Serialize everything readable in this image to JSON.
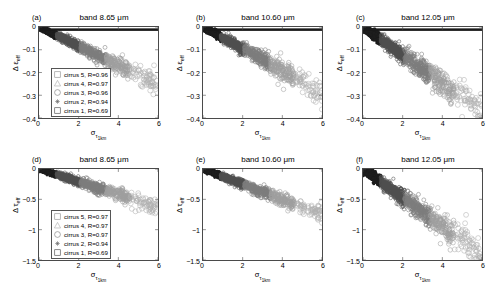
{
  "figure": {
    "background": "#ffffff",
    "width": 495,
    "height": 288
  },
  "axis_labels": {
    "y_top": "Δ ε",
    "y_top_sub": "eff",
    "y_bottom": "Δ τ",
    "y_bottom_sub": "eff",
    "x_main": "σ",
    "x_sub": "τ",
    "x_sub2": "1km"
  },
  "legend_title_common": "cirrus",
  "panels": [
    {
      "letter": "(a)",
      "title": "band 8.65 μm",
      "has_legend": true,
      "legend": [
        {
          "marker": "square-open",
          "label": "cirrus 5, R=0.96",
          "color": "#9a9a9a"
        },
        {
          "marker": "triangle-open",
          "label": "cirrus 4, R=0.97",
          "color": "#b5b5b5"
        },
        {
          "marker": "circle-open",
          "label": "cirrus 3, R=0.96",
          "color": "#8a8a8a"
        },
        {
          "marker": "star",
          "label": "cirrus 2, R=0.94",
          "color": "#6d6d6d"
        },
        {
          "marker": "square-open",
          "label": "cirrus 1, R=0.69",
          "color": "#5a5a5a"
        }
      ]
    },
    {
      "letter": "(b)",
      "title": "band 10.60 μm",
      "has_legend": false,
      "legend": []
    },
    {
      "letter": "(c)",
      "title": "band 12.05 μm",
      "has_legend": false,
      "legend": []
    },
    {
      "letter": "(d)",
      "title": "band 8.65 μm",
      "has_legend": true,
      "legend": [
        {
          "marker": "square-open",
          "label": "cirrus 5, R=0.97",
          "color": "#9a9a9a"
        },
        {
          "marker": "triangle-open",
          "label": "cirrus 4, R=0.97",
          "color": "#b5b5b5"
        },
        {
          "marker": "circle-open",
          "label": "cirrus 3, R=0.97",
          "color": "#8a8a8a"
        },
        {
          "marker": "star",
          "label": "cirrus 2, R=0.94",
          "color": "#6d6d6d"
        },
        {
          "marker": "square-open",
          "label": "cirrus 1, R=0.69",
          "color": "#5a5a5a"
        }
      ]
    },
    {
      "letter": "(e)",
      "title": "band 10.60 μm",
      "has_legend": false,
      "legend": []
    },
    {
      "letter": "(f)",
      "title": "band 12.05 μm",
      "has_legend": false,
      "legend": []
    }
  ],
  "chart_data": [
    {
      "id": "a",
      "type": "scatter",
      "title": "band 8.65 μm",
      "panel_letter": "(a)",
      "xlabel": "σ_τ1km",
      "ylabel": "Δ ε_eff",
      "xlim": [
        0,
        6
      ],
      "ylim": [
        -0.4,
        0
      ],
      "xticks": [
        0,
        2,
        4,
        6
      ],
      "yticks": [
        0,
        -0.1,
        -0.2,
        -0.3,
        -0.4
      ],
      "grid": false,
      "legend_position": "lower-left",
      "slope": -0.042,
      "spread": 0.018,
      "series": [
        {
          "name": "cirrus 5, R=0.96",
          "correlation": 0.96,
          "marker": "square-open",
          "color": "#9a9a9a"
        },
        {
          "name": "cirrus 4, R=0.97",
          "correlation": 0.97,
          "marker": "triangle-open",
          "color": "#b5b5b5"
        },
        {
          "name": "cirrus 3, R=0.96",
          "correlation": 0.96,
          "marker": "circle-open",
          "color": "#8a8a8a"
        },
        {
          "name": "cirrus 2, R=0.94",
          "correlation": 0.94,
          "marker": "star",
          "color": "#6d6d6d"
        },
        {
          "name": "cirrus 1, R=0.69",
          "correlation": 0.69,
          "marker": "square-open",
          "color": "#5a5a5a"
        }
      ]
    },
    {
      "id": "b",
      "type": "scatter",
      "title": "band 10.60 μm",
      "panel_letter": "(b)",
      "xlabel": "σ_τ1km",
      "ylabel": "Δ ε_eff",
      "xlim": [
        0,
        6
      ],
      "ylim": [
        -0.4,
        0
      ],
      "xticks": [
        0,
        2,
        4,
        6
      ],
      "yticks": [
        0,
        -0.1,
        -0.2,
        -0.3,
        -0.4
      ],
      "grid": false,
      "legend_position": "none",
      "slope": -0.048,
      "spread": 0.022
    },
    {
      "id": "c",
      "type": "scatter",
      "title": "band 12.05 μm",
      "panel_letter": "(c)",
      "xlabel": "σ_τ1km",
      "ylabel": "Δ ε_eff",
      "xlim": [
        0,
        6
      ],
      "ylim": [
        -0.4,
        0
      ],
      "xticks": [
        0,
        2,
        4,
        6
      ],
      "yticks": [
        0,
        -0.1,
        -0.2,
        -0.3,
        -0.4
      ],
      "grid": false,
      "legend_position": "none",
      "slope": -0.062,
      "spread": 0.028
    },
    {
      "id": "d",
      "type": "scatter",
      "title": "band 8.65 μm",
      "panel_letter": "(d)",
      "xlabel": "σ_τ1km",
      "ylabel": "Δ τ_eff",
      "xlim": [
        0,
        6
      ],
      "ylim": [
        -1.5,
        0
      ],
      "xticks": [
        0,
        2,
        4,
        6
      ],
      "yticks": [
        0,
        -0.5,
        -1,
        -1.5
      ],
      "grid": false,
      "legend_position": "lower-left",
      "slope": -0.105,
      "spread": 0.055,
      "series": [
        {
          "name": "cirrus 5, R=0.97",
          "correlation": 0.97,
          "marker": "square-open",
          "color": "#9a9a9a"
        },
        {
          "name": "cirrus 4, R=0.97",
          "correlation": 0.97,
          "marker": "triangle-open",
          "color": "#b5b5b5"
        },
        {
          "name": "cirrus 3, R=0.97",
          "correlation": 0.97,
          "marker": "circle-open",
          "color": "#8a8a8a"
        },
        {
          "name": "cirrus 2, R=0.94",
          "correlation": 0.94,
          "marker": "star",
          "color": "#6d6d6d"
        },
        {
          "name": "cirrus 1, R=0.69",
          "correlation": 0.69,
          "marker": "square-open",
          "color": "#5a5a5a"
        }
      ]
    },
    {
      "id": "e",
      "type": "scatter",
      "title": "band 10.60 μm",
      "panel_letter": "(e)",
      "xlabel": "σ_τ1km",
      "ylabel": "Δ τ_eff",
      "xlim": [
        0,
        6
      ],
      "ylim": [
        -1.5,
        0
      ],
      "xticks": [
        0,
        2,
        4,
        6
      ],
      "yticks": [
        0,
        -0.5,
        -1,
        -1.5
      ],
      "grid": false,
      "legend_position": "none",
      "slope": -0.125,
      "spread": 0.06
    },
    {
      "id": "f",
      "type": "scatter",
      "title": "band 12.05 μm",
      "panel_letter": "(f)",
      "xlabel": "σ_τ1km",
      "ylabel": "Δ τ_eff",
      "xlim": [
        0,
        6
      ],
      "ylim": [
        -1.5,
        0
      ],
      "xticks": [
        0,
        2,
        4,
        6
      ],
      "yticks": [
        0,
        -0.5,
        -1,
        -1.5
      ],
      "grid": false,
      "legend_position": "none",
      "slope": -0.235,
      "spread": 0.105
    }
  ]
}
